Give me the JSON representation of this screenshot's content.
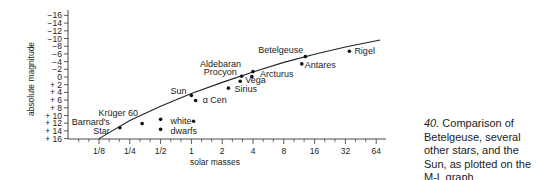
{
  "caption": {
    "number": "40.",
    "text": "Comparison of Betelgeuse, several other stars, and the Sun, as plotted on the M-L graph."
  },
  "chart_data": {
    "type": "scatter",
    "title": "",
    "xlabel": "solar masses",
    "ylabel": "absolute magnitude",
    "xscale": "log2",
    "x_ticks": [
      {
        "value": 0.125,
        "label": "1/8"
      },
      {
        "value": 0.25,
        "label": "1/4"
      },
      {
        "value": 0.5,
        "label": "1/2"
      },
      {
        "value": 1,
        "label": "1"
      },
      {
        "value": 2,
        "label": "2"
      },
      {
        "value": 4,
        "label": "4"
      },
      {
        "value": 8,
        "label": "8"
      },
      {
        "value": 16,
        "label": "16"
      },
      {
        "value": 32,
        "label": "32"
      },
      {
        "value": 64,
        "label": "64"
      }
    ],
    "y_ticks": [
      {
        "value": -16,
        "label": "−16"
      },
      {
        "value": -14,
        "label": "−14"
      },
      {
        "value": -12,
        "label": "−12"
      },
      {
        "value": -10,
        "label": "−10"
      },
      {
        "value": -8,
        "label": "−8"
      },
      {
        "value": -6,
        "label": "−6"
      },
      {
        "value": -4,
        "label": "−4"
      },
      {
        "value": -2,
        "label": "−2"
      },
      {
        "value": 0,
        "label": "0"
      },
      {
        "value": 2,
        "label": "+ 2"
      },
      {
        "value": 4,
        "label": "+ 4"
      },
      {
        "value": 6,
        "label": "+ 6"
      },
      {
        "value": 8,
        "label": "+ 8"
      },
      {
        "value": 10,
        "label": "+ 10"
      },
      {
        "value": 12,
        "label": "+ 12"
      },
      {
        "value": 14,
        "label": "+ 14"
      },
      {
        "value": 16,
        "label": "+ 16"
      }
    ],
    "ylim": [
      16,
      -17
    ],
    "xlim": [
      0.06,
      90
    ],
    "grid": false,
    "legend": null,
    "series": [
      {
        "name": "stars",
        "points": [
          {
            "label": "Barnard's Star",
            "mass": 0.2,
            "mag": 13.2
          },
          {
            "label": "Krüger 60",
            "mass": 0.33,
            "mag": 12.1
          },
          {
            "label": "white dwarfs",
            "mass": 0.5,
            "mag": 11.0
          },
          {
            "label": "",
            "mass": 0.5,
            "mag": 13.6
          },
          {
            "label": "",
            "mass": 1.05,
            "mag": 11.5
          },
          {
            "label": "Sun",
            "mass": 1.0,
            "mag": 4.8
          },
          {
            "label": "α Cen",
            "mass": 1.1,
            "mag": 6.1
          },
          {
            "label": "Sirius",
            "mass": 2.3,
            "mag": 2.9
          },
          {
            "label": "Vega",
            "mass": 3.0,
            "mag": 1.1
          },
          {
            "label": "Procyon",
            "mass": 3.1,
            "mag": -0.2
          },
          {
            "label": "Aldebaran",
            "mass": 4.0,
            "mag": -1.4
          },
          {
            "label": "Arcturus",
            "mass": 3.9,
            "mag": -0.1
          },
          {
            "label": "Antares",
            "mass": 12.0,
            "mag": -3.4
          },
          {
            "label": "Betelgeuse",
            "mass": 13.0,
            "mag": -5.3
          },
          {
            "label": "Rigel",
            "mass": 35.0,
            "mag": -6.7
          }
        ]
      },
      {
        "name": "M-L relation",
        "type": "line",
        "points": [
          {
            "mass": 0.125,
            "mag": 16
          },
          {
            "mass": 0.25,
            "mag": 11.3
          },
          {
            "mass": 0.5,
            "mag": 7.6
          },
          {
            "mass": 1.0,
            "mag": 4.3
          },
          {
            "mass": 2.0,
            "mag": 1.4
          },
          {
            "mass": 4.0,
            "mag": -1.3
          },
          {
            "mass": 8.0,
            "mag": -3.8
          },
          {
            "mass": 16.0,
            "mag": -5.9
          },
          {
            "mass": 32.0,
            "mag": -7.8
          },
          {
            "mass": 70.0,
            "mag": -9.6
          }
        ]
      }
    ]
  }
}
